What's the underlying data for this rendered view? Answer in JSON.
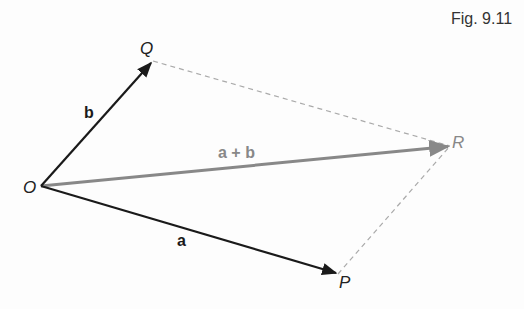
{
  "figure": {
    "caption": "Fig. 9.11",
    "points": {
      "O": {
        "label": "O",
        "x": 41,
        "y": 186
      },
      "P": {
        "label": "P",
        "x": 338,
        "y": 274
      },
      "Q": {
        "label": "Q",
        "x": 153,
        "y": 61
      },
      "R": {
        "label": "R",
        "x": 450,
        "y": 146
      }
    },
    "vectors": [
      {
        "name": "a",
        "label": "a",
        "from": "O",
        "to": "P",
        "color": "#1a1a1a"
      },
      {
        "name": "b",
        "label": "b",
        "from": "O",
        "to": "Q",
        "color": "#1a1a1a"
      },
      {
        "name": "a_plus_b",
        "label": "a + b",
        "from": "O",
        "to": "R",
        "color": "#888888"
      }
    ],
    "dashed_edges": [
      {
        "from": "Q",
        "to": "R",
        "color": "#aaaaaa"
      },
      {
        "from": "P",
        "to": "R",
        "color": "#aaaaaa"
      }
    ]
  }
}
